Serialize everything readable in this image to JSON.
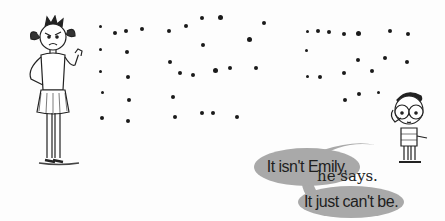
{
  "illustration": {
    "speech_bubbles": [
      {
        "text": "It isn't Emily,"
      },
      {
        "text": "It just can't be."
      }
    ],
    "narration": "he says.",
    "characters": [
      {
        "name": "girl-with-pigtails",
        "pose": "hand on hip, scowling"
      },
      {
        "name": "boy-with-glasses",
        "pose": "hand on head"
      }
    ],
    "colors": {
      "bubble": "#a9a9a9",
      "ink": "#1a1a1a",
      "background": "#fdfdfd"
    }
  }
}
